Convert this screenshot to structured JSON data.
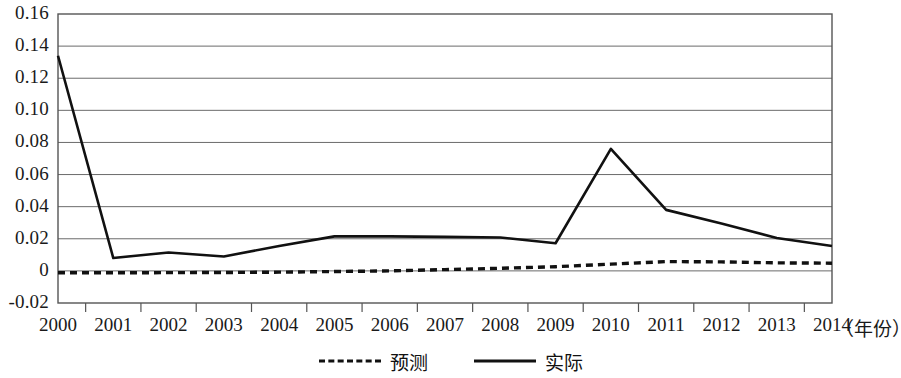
{
  "chart_data": {
    "type": "line",
    "title": "",
    "xlabel": "（年份）",
    "ylabel": "",
    "x": [
      2000,
      2001,
      2002,
      2003,
      2004,
      2005,
      2006,
      2007,
      2008,
      2009,
      2010,
      2011,
      2012,
      2013,
      2014
    ],
    "categories": [
      "2000",
      "2001",
      "2002",
      "2003",
      "2004",
      "2005",
      "2006",
      "2007",
      "2008",
      "2009",
      "2010",
      "2011",
      "2012",
      "2013",
      "2014"
    ],
    "series": [
      {
        "name": "预测",
        "style": "dotted",
        "color": "#111111",
        "values": [
          -0.0012,
          -0.0012,
          -0.0011,
          -0.001,
          -0.0008,
          -0.0004,
          0.0,
          0.0008,
          0.0016,
          0.0026,
          0.0042,
          0.0058,
          0.0056,
          0.005,
          0.0048
        ]
      },
      {
        "name": "实际",
        "style": "solid",
        "color": "#111111",
        "values": [
          0.134,
          0.008,
          0.0115,
          0.009,
          0.0155,
          0.0215,
          0.0215,
          0.0212,
          0.0208,
          0.0172,
          0.076,
          0.038,
          0.0295,
          0.0205,
          0.0155
        ]
      }
    ],
    "ylim": [
      -0.02,
      0.16
    ],
    "yticks": [
      -0.02,
      0,
      0.02,
      0.04,
      0.06,
      0.08,
      0.1,
      0.12,
      0.14,
      0.16
    ],
    "ytick_labels": [
      "-0.02",
      "0",
      "0.02",
      "0.04",
      "0.06",
      "0.08",
      "0.10",
      "0.12",
      "0.14",
      "0.16"
    ],
    "grid": true,
    "grid_axis": "y",
    "legend_position": "bottom-center",
    "legend_entries": [
      "预测",
      "实际"
    ],
    "frame": true
  },
  "axis": {
    "x_title": "（年份）"
  },
  "legend": {
    "forecast_label": "预测",
    "actual_label": "实际"
  }
}
